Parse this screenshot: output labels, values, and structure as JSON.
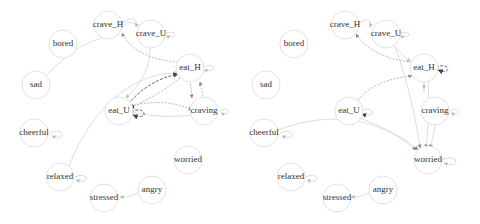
{
  "graphs": [
    {
      "id": "left",
      "nodes": [
        {
          "label": "crave_H",
          "x": 108,
          "y": 25
        },
        {
          "label": "crave_U",
          "x": 151,
          "y": 34
        },
        {
          "label": "bored",
          "x": 63,
          "y": 44
        },
        {
          "label": "sad",
          "x": 36,
          "y": 85
        },
        {
          "label": "eat_H",
          "x": 190,
          "y": 68
        },
        {
          "label": "eat_U",
          "x": 119,
          "y": 111
        },
        {
          "label": "craving",
          "x": 204,
          "y": 111
        },
        {
          "label": "cheerful",
          "x": 34,
          "y": 133
        },
        {
          "label": "worried",
          "x": 188,
          "y": 160
        },
        {
          "label": "relaxed",
          "x": 60,
          "y": 177
        },
        {
          "label": "angry",
          "x": 152,
          "y": 190
        },
        {
          "label": "stressed",
          "x": 104,
          "y": 198
        }
      ]
    },
    {
      "id": "right",
      "nodes": [
        {
          "label": "crave_H",
          "x": 345,
          "y": 25
        },
        {
          "label": "crave_U",
          "x": 386,
          "y": 34
        },
        {
          "label": "bored",
          "x": 294,
          "y": 44
        },
        {
          "label": "sad",
          "x": 266,
          "y": 85
        },
        {
          "label": "eat_H",
          "x": 424,
          "y": 68
        },
        {
          "label": "eat_U",
          "x": 349,
          "y": 111
        },
        {
          "label": "craving",
          "x": 435,
          "y": 111
        },
        {
          "label": "cheerful",
          "x": 264,
          "y": 133
        },
        {
          "label": "worried",
          "x": 428,
          "y": 160
        },
        {
          "label": "relaxed",
          "x": 291,
          "y": 177
        },
        {
          "label": "angry",
          "x": 383,
          "y": 190
        },
        {
          "label": "stressed",
          "x": 337,
          "y": 198
        }
      ]
    }
  ]
}
